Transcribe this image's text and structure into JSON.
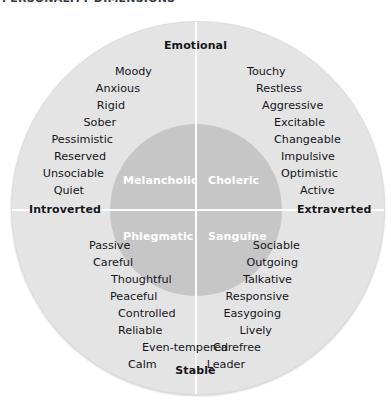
{
  "header": {
    "clipped_text": "PERSONALITY DIMENSIONS"
  },
  "poles": {
    "top": "Emotional",
    "bottom": "Stable",
    "left": "Introverted",
    "right": "Extraverted"
  },
  "quadrant_labels": {
    "top_left": "Melancholic",
    "top_right": "Choleric",
    "bottom_left": "Phlegmatic",
    "bottom_right": "Sanguine"
  },
  "traits": {
    "melancholic": [
      "Moody",
      "Anxious",
      "Rigid",
      "Sober",
      "Pessimistic",
      "Reserved",
      "Unsociable",
      "Quiet"
    ],
    "choleric": [
      "Touchy",
      "Restless",
      "Aggressive",
      "Excitable",
      "Changeable",
      "Impulsive",
      "Optimistic",
      "Active"
    ],
    "phlegmatic": [
      "Passive",
      "Careful",
      "Thoughtful",
      "Peaceful",
      "Controlled",
      "Reliable",
      "Even-tempered",
      "Calm"
    ],
    "sanguine": [
      "Sociable",
      "Outgoing",
      "Talkative",
      "Responsive",
      "Easygoing",
      "Lively",
      "Carefree",
      "Leader"
    ]
  },
  "colors": {
    "outer_circle": "#e4e4e4",
    "inner_circle": "#c6c6c6",
    "axis_line": "#fcfcfc",
    "text": "#15151a",
    "quadrant_text": "#ffffff",
    "background": "#ffffff"
  },
  "layout": {
    "melancholic_positions": [
      {
        "x": 152,
        "y": 66
      },
      {
        "x": 140,
        "y": 83
      },
      {
        "x": 125,
        "y": 100
      },
      {
        "x": 116,
        "y": 117
      },
      {
        "x": 113,
        "y": 134
      },
      {
        "x": 106,
        "y": 151
      },
      {
        "x": 104,
        "y": 168
      },
      {
        "x": 84,
        "y": 185
      }
    ],
    "choleric_positions": [
      {
        "x": 247,
        "y": 66
      },
      {
        "x": 256,
        "y": 83
      },
      {
        "x": 262,
        "y": 100
      },
      {
        "x": 274,
        "y": 117
      },
      {
        "x": 274,
        "y": 134
      },
      {
        "x": 281,
        "y": 151
      },
      {
        "x": 281,
        "y": 168
      },
      {
        "x": 300,
        "y": 185
      }
    ],
    "phlegmatic_positions": [
      {
        "x": 89,
        "y": 240
      },
      {
        "x": 93,
        "y": 257
      },
      {
        "x": 111,
        "y": 274
      },
      {
        "x": 110,
        "y": 291
      },
      {
        "x": 118,
        "y": 308
      },
      {
        "x": 118,
        "y": 325
      },
      {
        "x": 142,
        "y": 342
      },
      {
        "x": 128,
        "y": 359
      }
    ],
    "sanguine_positions": [
      {
        "x": 300,
        "y": 240
      },
      {
        "x": 298,
        "y": 257
      },
      {
        "x": 292,
        "y": 274
      },
      {
        "x": 289,
        "y": 291
      },
      {
        "x": 281,
        "y": 308
      },
      {
        "x": 272,
        "y": 325
      },
      {
        "x": 261,
        "y": 342
      },
      {
        "x": 245,
        "y": 359
      }
    ]
  }
}
